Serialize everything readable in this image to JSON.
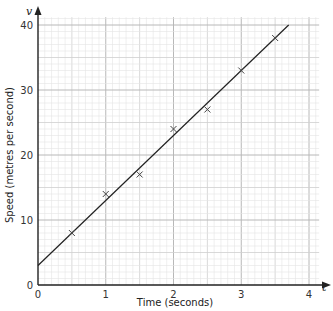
{
  "chart_data": {
    "type": "scatter",
    "title": "",
    "xlabel": "Time (seconds)",
    "ylabel": "Speed (metres per second)",
    "x_axis_symbol": "t",
    "y_axis_symbol": "v",
    "xlim": [
      0,
      4
    ],
    "ylim": [
      0,
      40
    ],
    "x_ticks": [
      "0",
      "1",
      "2",
      "3",
      "4"
    ],
    "y_ticks": [
      "0",
      "10",
      "20",
      "30",
      "40"
    ],
    "grid": true,
    "grid_minor": {
      "x_step": 0.1,
      "y_step": 1
    },
    "grid_medium": {
      "x_step": 0.5,
      "y_step": 5
    },
    "grid_major": {
      "x_step": 1,
      "y_step": 10
    },
    "marker": "x",
    "x": [
      0.5,
      1,
      1.5,
      2,
      2.5,
      3,
      3.5
    ],
    "y": [
      8,
      14,
      17,
      24,
      27,
      33,
      38
    ],
    "best_fit_line": {
      "x0": 0,
      "y0": 3,
      "x1": 3.7,
      "y1": 40
    },
    "legend": null
  },
  "colors": {
    "axis": "#222222",
    "line": "#222222",
    "marker": "#444444",
    "grid_minor": "#e4e4e4",
    "grid_medium": "#cfcfcf",
    "grid_major": "#b8b8b8"
  }
}
